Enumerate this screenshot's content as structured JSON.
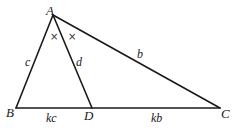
{
  "diagram": {
    "type": "triangle-angle-bisector",
    "colors": {
      "stroke": "#1a1a1a",
      "background": "#ffffff"
    },
    "points": {
      "A": {
        "label": "A",
        "x": 53,
        "y": 15
      },
      "B": {
        "label": "B",
        "x": 16,
        "y": 108
      },
      "C": {
        "label": "C",
        "x": 220,
        "y": 108
      },
      "D": {
        "label": "D",
        "x": 92,
        "y": 108
      }
    },
    "segments": {
      "AB": {
        "label": "c"
      },
      "AD": {
        "label": "d"
      },
      "AC": {
        "label": "b"
      },
      "BD": {
        "label": "kc"
      },
      "DC": {
        "label": "kb"
      }
    },
    "angle_marks": [
      "×",
      "×"
    ]
  }
}
